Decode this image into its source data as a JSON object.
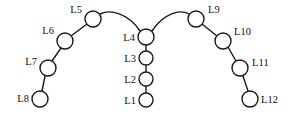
{
  "diagram": {
    "background_color": "#ffffff",
    "stroke_color": "#1a1a1a",
    "node_fill_color": "#ffffff",
    "label_color": "#111111",
    "node_radius": 7,
    "nodes": [
      {
        "id": "L1",
        "label": "L1",
        "cx": 146,
        "cy": 100,
        "r": 7,
        "label_x": 136,
        "label_y": 104,
        "label_side": "right"
      },
      {
        "id": "L2",
        "label": "L2",
        "cx": 146,
        "cy": 79,
        "r": 7,
        "label_x": 136,
        "label_y": 83,
        "label_side": "right"
      },
      {
        "id": "L3",
        "label": "L3",
        "cx": 146,
        "cy": 58,
        "r": 7,
        "label_x": 136,
        "label_y": 62,
        "label_side": "right"
      },
      {
        "id": "L4",
        "label": "L4",
        "cx": 146,
        "cy": 37,
        "r": 8,
        "label_x": 135,
        "label_y": 41,
        "label_side": "right"
      },
      {
        "id": "L5",
        "label": "L5",
        "cx": 93,
        "cy": 19,
        "r": 8,
        "label_x": 82,
        "label_y": 13,
        "label_side": "right"
      },
      {
        "id": "L6",
        "label": "L6",
        "cx": 65,
        "cy": 41,
        "r": 8,
        "label_x": 54,
        "label_y": 34,
        "label_side": "right"
      },
      {
        "id": "L7",
        "label": "L7",
        "cx": 48,
        "cy": 68,
        "r": 8,
        "label_x": 37,
        "label_y": 65,
        "label_side": "right"
      },
      {
        "id": "L8",
        "label": "L8",
        "cx": 40,
        "cy": 99,
        "r": 8,
        "label_x": 29,
        "label_y": 102,
        "label_side": "right"
      },
      {
        "id": "L9",
        "label": "L9",
        "cx": 196,
        "cy": 19,
        "r": 8,
        "label_x": 208,
        "label_y": 13,
        "label_side": "left"
      },
      {
        "id": "L10",
        "label": "L10",
        "cx": 223,
        "cy": 41,
        "r": 8,
        "label_x": 234,
        "label_y": 35,
        "label_side": "left"
      },
      {
        "id": "L11",
        "label": "L11",
        "cx": 240,
        "cy": 68,
        "r": 8,
        "label_x": 252,
        "label_y": 66,
        "label_side": "left"
      },
      {
        "id": "L12",
        "label": "L12",
        "cx": 250,
        "cy": 99,
        "r": 8,
        "label_x": 261,
        "label_y": 103,
        "label_side": "left"
      }
    ],
    "links": [
      {
        "from": "L1",
        "to": "L2",
        "type": "line",
        "x1": 146,
        "y1": 93,
        "x2": 146,
        "y2": 86
      },
      {
        "from": "L2",
        "to": "L3",
        "type": "line",
        "x1": 146,
        "y1": 72,
        "x2": 146,
        "y2": 65
      },
      {
        "from": "L3",
        "to": "L4",
        "type": "line",
        "x1": 146,
        "y1": 51,
        "x2": 146,
        "y2": 45
      },
      {
        "from": "L4",
        "to": "L5",
        "type": "arc",
        "path": "M 140 31 C 128 13 110 9 100 14"
      },
      {
        "from": "L5",
        "to": "L6",
        "type": "line",
        "x1": 87,
        "y1": 24,
        "x2": 71,
        "y2": 36
      },
      {
        "from": "L6",
        "to": "L7",
        "type": "line",
        "x1": 61,
        "y1": 48,
        "x2": 52,
        "y2": 61
      },
      {
        "from": "L7",
        "to": "L8",
        "type": "line",
        "x1": 45,
        "y1": 76,
        "x2": 42,
        "y2": 91
      },
      {
        "from": "L4",
        "to": "L9",
        "type": "arc",
        "path": "M 152 31 C 164 13 180 9 189 14"
      },
      {
        "from": "L9",
        "to": "L10",
        "type": "line",
        "x1": 202,
        "y1": 24,
        "x2": 217,
        "y2": 36
      },
      {
        "from": "L10",
        "to": "L11",
        "type": "line",
        "x1": 228,
        "y1": 47,
        "x2": 236,
        "y2": 61
      },
      {
        "from": "L11",
        "to": "L12",
        "type": "line",
        "x1": 243,
        "y1": 76,
        "x2": 248,
        "y2": 91
      }
    ]
  }
}
